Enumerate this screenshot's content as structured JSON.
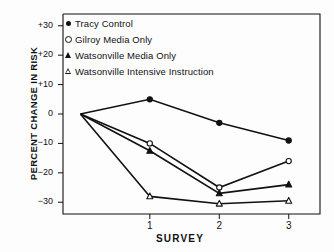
{
  "chart_data": {
    "type": "line",
    "title": "",
    "xlabel": "SURVEY",
    "ylabel": "PERCENT CHANGE IN RISK",
    "x": [
      0,
      1,
      2,
      3
    ],
    "categories": [
      "",
      "1",
      "2",
      "3"
    ],
    "xtick_labels": [
      "1",
      "2",
      "3"
    ],
    "ytick_labels": [
      "+30",
      "+20",
      "+10",
      "0",
      "−10",
      "−20",
      "−30"
    ],
    "ytick_values": [
      30,
      20,
      10,
      0,
      -10,
      -20,
      -30
    ],
    "ylim": [
      -34,
      34
    ],
    "xlim": [
      -0.25,
      3.45
    ],
    "grid": false,
    "legend_position": "top-left-inside",
    "series": [
      {
        "name": "Tracy Control",
        "marker": "filled-circle",
        "values": [
          0,
          5,
          -3,
          -9
        ]
      },
      {
        "name": "Gilroy Media Only",
        "marker": "open-circle",
        "values": [
          0,
          -10,
          -25,
          -16
        ]
      },
      {
        "name": "Watsonville Media Only",
        "marker": "filled-triangle",
        "values": [
          0,
          -12.5,
          -27,
          -24
        ]
      },
      {
        "name": "Watsonville Intensive Instruction",
        "marker": "open-triangle",
        "values": [
          0,
          -28,
          -30.5,
          -29.5
        ]
      }
    ],
    "line_color": "#111111",
    "background_color": "#ffffff"
  },
  "legend": {
    "items": [
      {
        "label": "Tracy Control",
        "marker": "filled-circle"
      },
      {
        "label": "Gilroy Media Only",
        "marker": "open-circle"
      },
      {
        "label": "Watsonville Media Only",
        "marker": "filled-triangle"
      },
      {
        "label": "Watsonville Intensive Instruction",
        "marker": "open-triangle"
      }
    ]
  },
  "axes": {
    "y_title": "PERCENT CHANGE IN RISK",
    "x_title": "SURVEY",
    "y_ticks": [
      "+30",
      "+20",
      "+10",
      "0",
      "−10",
      "−20",
      "−30"
    ],
    "x_ticks": [
      "1",
      "2",
      "3"
    ]
  }
}
